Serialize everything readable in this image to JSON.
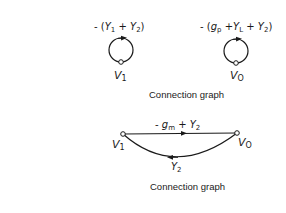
{
  "graph1": {
    "loop1": {
      "label_prefix": "- (",
      "label_a": "Y",
      "label_a_sub": "1",
      "label_plus": " + ",
      "label_b": "Y",
      "label_b_sub": "2",
      "label_suffix": ")",
      "node": "V",
      "node_sub": "1"
    },
    "loop2": {
      "label_prefix": "- (",
      "label_a": "g",
      "label_a_sub": "p",
      "label_plus1": " +",
      "label_b": "Y",
      "label_b_sub": "L",
      "label_plus2": " + ",
      "label_c": "Y",
      "label_c_sub": "2",
      "label_suffix": ")",
      "node": "V",
      "node_sub": "O"
    },
    "caption": "Connection graph"
  },
  "graph2": {
    "node_left": "V",
    "node_left_sub": "1",
    "node_right": "V",
    "node_right_sub": "O",
    "top_edge": {
      "prefix": "- ",
      "a": "g",
      "a_sub": "m",
      "plus": " + ",
      "b": "Y",
      "b_sub": "2"
    },
    "bottom_edge": {
      "a": "Y",
      "a_sub": "2"
    },
    "caption": "Connection graph"
  },
  "colors": {
    "ink": "#1a1a1a",
    "background": "#ffffff"
  }
}
